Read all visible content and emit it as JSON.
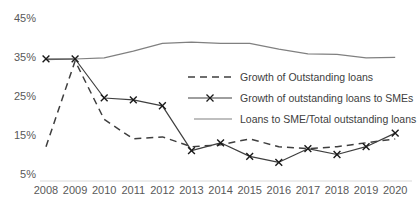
{
  "chart_data": {
    "type": "line",
    "title": "",
    "xlabel": "",
    "ylabel": "",
    "ylim": [
      5,
      45
    ],
    "ytick_labels": [
      "45%",
      "35%",
      "25%",
      "15%",
      "5%"
    ],
    "ytick_values": [
      45,
      35,
      25,
      15,
      5
    ],
    "grid": false,
    "legend_position": "center-right-inside",
    "x": [
      2008,
      2009,
      2010,
      2011,
      2012,
      2013,
      2014,
      2015,
      2016,
      2017,
      2018,
      2019,
      2020
    ],
    "xtick_labels": [
      "2008",
      "2009",
      "2010",
      "2011",
      "2012",
      "2013",
      "2014",
      "2015",
      "2016",
      "2017",
      "2018",
      "2019",
      "2020"
    ],
    "series": [
      {
        "name": "Growth of Outstanding loans",
        "style": "dashed",
        "color": "#3f3f3f",
        "marker": "none",
        "values": [
          12.0,
          34.0,
          19.0,
          14.0,
          14.5,
          12.0,
          12.5,
          14.0,
          12.0,
          11.5,
          12.0,
          13.0,
          14.0
        ]
      },
      {
        "name": "Growth of outstanding loans to SMEs",
        "style": "solid",
        "color": "#3f3f3f",
        "marker": "x",
        "values": [
          34.5,
          34.5,
          24.5,
          24.0,
          22.5,
          11.0,
          13.0,
          9.5,
          8.0,
          11.5,
          10.0,
          12.0,
          15.5
        ]
      },
      {
        "name": "Loans to SME/Total outstanding loans",
        "style": "solid",
        "color": "#808080",
        "marker": "none",
        "values": [
          34.3,
          34.5,
          34.8,
          36.5,
          38.5,
          38.8,
          38.5,
          38.5,
          37.0,
          35.8,
          35.7,
          34.8,
          34.9
        ]
      }
    ]
  },
  "legend": {
    "items": [
      {
        "label": "Growth of Outstanding loans",
        "key": "dashed-line-key"
      },
      {
        "label": "Growth of outstanding loans to SMEs",
        "key": "solid-line-x-marker-key"
      },
      {
        "label": "Loans to SME/Total outstanding loans",
        "key": "gray-line-key"
      }
    ]
  }
}
